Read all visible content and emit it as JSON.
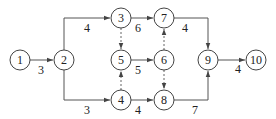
{
  "diagram": {
    "type": "activity-on-arrow network",
    "nodes": [
      {
        "id": "1",
        "label": "1",
        "x": 20,
        "y": 60
      },
      {
        "id": "2",
        "label": "2",
        "x": 64,
        "y": 60
      },
      {
        "id": "3",
        "label": "3",
        "x": 121,
        "y": 18
      },
      {
        "id": "4",
        "label": "4",
        "x": 121,
        "y": 100
      },
      {
        "id": "5",
        "label": "5",
        "x": 121,
        "y": 60
      },
      {
        "id": "6",
        "label": "6",
        "x": 164,
        "y": 60
      },
      {
        "id": "7",
        "label": "7",
        "x": 164,
        "y": 18
      },
      {
        "id": "8",
        "label": "8",
        "x": 164,
        "y": 100
      },
      {
        "id": "9",
        "label": "9",
        "x": 208,
        "y": 60
      },
      {
        "id": "10",
        "label": "10",
        "x": 256,
        "y": 60
      }
    ],
    "edges": [
      {
        "from": "1",
        "to": "2",
        "duration": "3",
        "dashed": false
      },
      {
        "from": "2",
        "to": "3",
        "duration": "4",
        "dashed": false
      },
      {
        "from": "2",
        "to": "4",
        "duration": "3",
        "dashed": false
      },
      {
        "from": "3",
        "to": "7",
        "duration": "6",
        "dashed": false
      },
      {
        "from": "3",
        "to": "5",
        "duration": "",
        "dashed": true
      },
      {
        "from": "4",
        "to": "5",
        "duration": "",
        "dashed": true
      },
      {
        "from": "5",
        "to": "6",
        "duration": "5",
        "dashed": false
      },
      {
        "from": "6",
        "to": "7",
        "duration": "",
        "dashed": true
      },
      {
        "from": "6",
        "to": "8",
        "duration": "",
        "dashed": true
      },
      {
        "from": "4",
        "to": "8",
        "duration": "4",
        "dashed": false
      },
      {
        "from": "7",
        "to": "9",
        "duration": "4",
        "dashed": false
      },
      {
        "from": "8",
        "to": "9",
        "duration": "7",
        "dashed": false
      },
      {
        "from": "9",
        "to": "10",
        "duration": "4",
        "dashed": false
      }
    ]
  }
}
